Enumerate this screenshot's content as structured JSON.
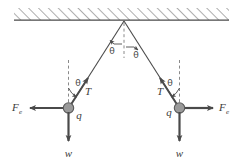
{
  "figure": {
    "background_color": "#ffffff",
    "line_color": "#4a4a4a",
    "ball_fill_color": "#9a9a9a",
    "ball_stroke_color": "#5a5a5a",
    "dashed_color": "#8a8a8a",
    "hatch_color": "#6a6a6a"
  },
  "ceiling": {
    "name": "hatched ceiling",
    "hatch_direction": "forward-slash",
    "solid_line_y": 20
  },
  "apex": {
    "angles": [
      {
        "id": "apex-left",
        "label": "θ"
      },
      {
        "id": "apex-right",
        "label": "θ"
      }
    ],
    "vertical_reference": "dashed"
  },
  "left_body": {
    "charge_label": "q",
    "tension_label": "T",
    "weight_label": "w",
    "electric_force_symbol": "F",
    "electric_force_subscript": "e",
    "angle_label": "θ",
    "force_direction": "left"
  },
  "right_body": {
    "charge_label": "q",
    "tension_label": "T",
    "weight_label": "w",
    "electric_force_symbol": "F",
    "electric_force_subscript": "e",
    "angle_label": "θ",
    "force_direction": "right"
  }
}
